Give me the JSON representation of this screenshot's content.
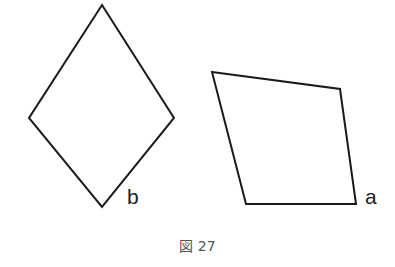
{
  "figure": {
    "caption": "図 27",
    "shapes": [
      {
        "id": "b",
        "label": "b",
        "type": "rhombus",
        "points": "102,5 174,118 102,207 29,118",
        "label_pos": [
          133,
          204
        ]
      },
      {
        "id": "a",
        "label": "a",
        "type": "quadrilateral",
        "points": "212,72 340,89 356,204 246,204",
        "label_pos": [
          366,
          204
        ]
      }
    ],
    "colors": {
      "stroke": "#1a1a1a",
      "caption": "#555555"
    }
  }
}
